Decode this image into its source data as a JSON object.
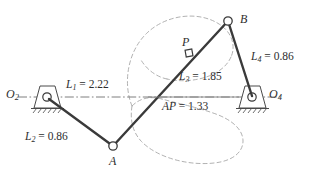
{
  "figure": {
    "kind": "fourbar-linkage-diagram",
    "background_color": "#ffffff",
    "link_color": "#3a3a3a",
    "coupler_curve_color": "#9a9a9a",
    "ground_line_color": "#6f6f6f",
    "text_color": "#2e2e2e"
  },
  "dimensions": {
    "ground_link": {
      "symbol": "L",
      "subscript": "1",
      "equals": "=",
      "value": "2.22",
      "text": "L₁ = 2.22"
    },
    "crank": {
      "symbol": "L",
      "subscript": "2",
      "equals": "=",
      "value": "0.86",
      "text": "L₂ = 0.86"
    },
    "coupler": {
      "symbol": "L",
      "subscript": "3",
      "equals": "=",
      "value": "1.85",
      "text": "L₃ = 1.85"
    },
    "rocker": {
      "symbol": "L",
      "subscript": "4",
      "equals": "=",
      "value": "0.86",
      "text": "L₄ = 0.86"
    },
    "coupler_point_offset": {
      "symbol": "AP",
      "equals": "=",
      "value": "1.33",
      "text": "AP = 1.33"
    }
  },
  "points": {
    "o2": {
      "symbol": "O",
      "subscript": "2",
      "text": "O₂"
    },
    "o4": {
      "symbol": "O",
      "subscript": "4",
      "text": "O₄"
    },
    "a": {
      "symbol": "A",
      "text": "A"
    },
    "b": {
      "symbol": "B",
      "text": "B"
    },
    "p": {
      "symbol": "P",
      "text": "P"
    }
  },
  "geometry": {
    "o2": {
      "x": 47,
      "y": 97
    },
    "o4": {
      "x": 252,
      "y": 97
    },
    "a": {
      "x": 113,
      "y": 146
    },
    "b": {
      "x": 228,
      "y": 21
    },
    "p": {
      "x": 189,
      "y": 53
    }
  }
}
